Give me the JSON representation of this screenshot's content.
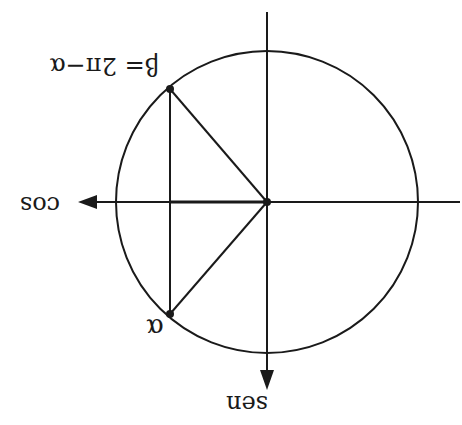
{
  "diagram": {
    "orientation": "rotated-180",
    "labels": {
      "beta": "β= 2π−α",
      "alpha": "α",
      "cos_axis": "cos",
      "sen_axis": "sen"
    },
    "geometry": {
      "center": [
        267,
        202
      ],
      "radius": 151,
      "point_beta": [
        170,
        89
      ],
      "point_alpha": [
        170,
        314
      ],
      "vertical_axis_top_y": 12,
      "vertical_axis_arrow_y": 388,
      "horizontal_axis_right_x": 460,
      "horizontal_axis_arrow_x": 78
    },
    "colors": {
      "stroke": "#1a1a1a",
      "background": "#ffffff"
    }
  }
}
